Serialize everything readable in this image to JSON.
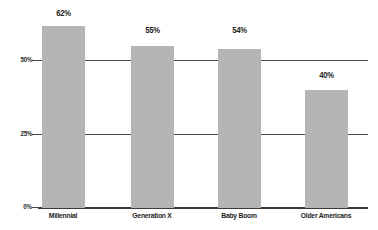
{
  "chart_data": {
    "type": "bar",
    "title": "",
    "subtitle": "",
    "xlabel": "",
    "ylabel": "",
    "categories": [
      "Millennial",
      "Generation X",
      "Baby Boom",
      "Older Americans"
    ],
    "values": [
      62,
      55,
      54,
      40
    ],
    "value_labels": [
      "62%",
      "55%",
      "54%",
      "40%"
    ],
    "ylim": [
      0,
      70
    ],
    "ytick_values": [
      0,
      25,
      50
    ],
    "ytick_labels": [
      "0%",
      "25%",
      "50%"
    ],
    "grid": true,
    "grid_axis": "y",
    "legend": false,
    "legend_position": "none",
    "orientation": "vertical",
    "colors": {
      "bar_fill": "#b5b5b5",
      "gridline": "#4a4a4a",
      "axis": "#3a3a3a",
      "text": "#1c1c1c",
      "background": "#ffffff"
    }
  }
}
